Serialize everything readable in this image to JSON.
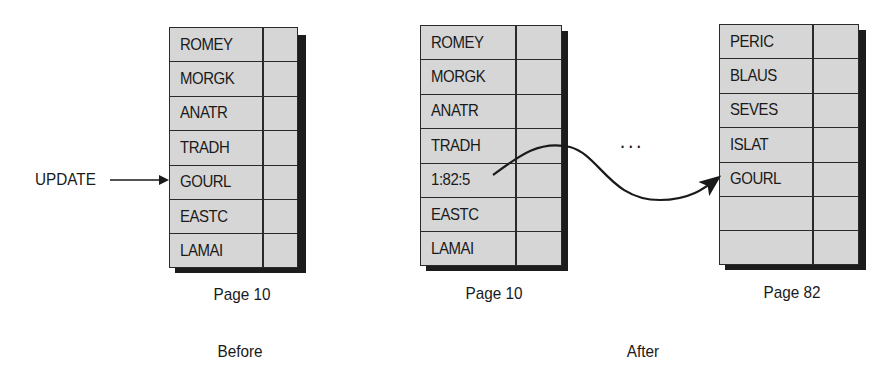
{
  "before": {
    "update_label": "UPDATE",
    "page": {
      "caption": "Page 10",
      "rows": [
        "ROMEY",
        "MORGK",
        "ANATR",
        "TRADH",
        "GOURL",
        "EASTC",
        "LAMAI"
      ]
    },
    "section_label": "Before"
  },
  "after": {
    "page_10": {
      "caption": "Page 10",
      "rows": [
        "ROMEY",
        "MORGK",
        "ANATR",
        "TRADH",
        "1:82:5",
        "EASTC",
        "LAMAI"
      ]
    },
    "ellipsis": "...",
    "page_82": {
      "caption": "Page 82",
      "rows": [
        "PERIC",
        "BLAUS",
        "SEVES",
        "ISLAT",
        "GOURL",
        "",
        ""
      ]
    },
    "section_label": "After"
  },
  "colors": {
    "cell_fill": "#d6d6d6",
    "line": "#2a2a2a",
    "shadow": "#1c1c1c"
  }
}
